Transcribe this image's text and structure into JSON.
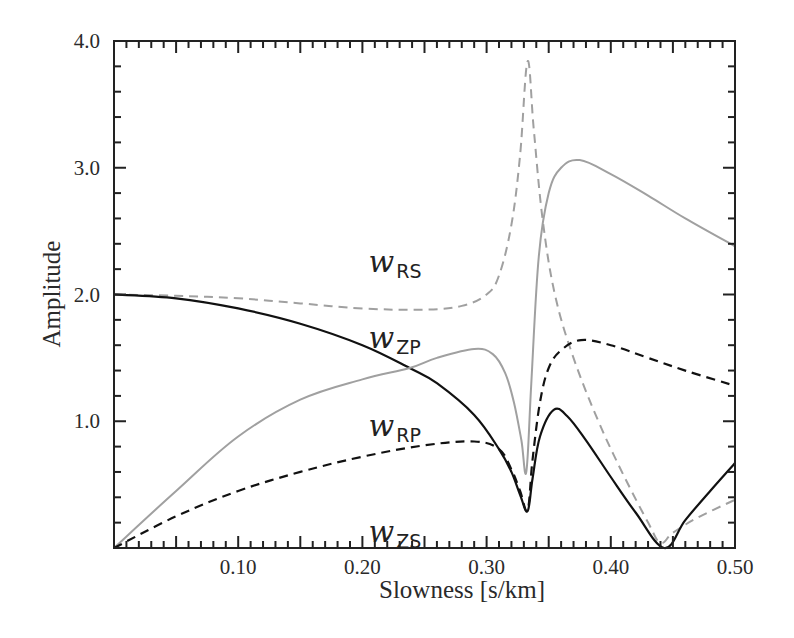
{
  "chart_data": {
    "type": "line",
    "title": "",
    "xlabel": "Slowness [s/km]",
    "ylabel": "Amplitude",
    "xlim": [
      0,
      0.5
    ],
    "ylim": [
      0,
      4.0
    ],
    "grid": false,
    "legend": "inline labels",
    "x_ticks": [
      0.1,
      0.2,
      0.3,
      0.4,
      0.5
    ],
    "x_tick_labels": [
      "0.10",
      "0.20",
      "0.30",
      "0.40",
      "0.50"
    ],
    "y_ticks": [
      1.0,
      2.0,
      3.0,
      4.0
    ],
    "y_tick_labels": [
      "1.0",
      "2.0",
      "3.0",
      "4.0"
    ],
    "series": [
      {
        "name": "w_RS",
        "label_main": "w",
        "label_sub": "RS",
        "style": "dashed",
        "color": "#a0a0a0",
        "points": [
          [
            0.0,
            2.0
          ],
          [
            0.05,
            1.99
          ],
          [
            0.1,
            1.97
          ],
          [
            0.15,
            1.93
          ],
          [
            0.2,
            1.89
          ],
          [
            0.25,
            1.88
          ],
          [
            0.28,
            1.91
          ],
          [
            0.3,
            2.0
          ],
          [
            0.31,
            2.15
          ],
          [
            0.32,
            2.55
          ],
          [
            0.327,
            3.1
          ],
          [
            0.333,
            3.84
          ],
          [
            0.338,
            3.3
          ],
          [
            0.345,
            2.6
          ],
          [
            0.355,
            2.0
          ],
          [
            0.37,
            1.5
          ],
          [
            0.39,
            1.0
          ],
          [
            0.41,
            0.58
          ],
          [
            0.43,
            0.2
          ],
          [
            0.44,
            0.04
          ],
          [
            0.45,
            0.12
          ],
          [
            0.47,
            0.24
          ],
          [
            0.5,
            0.38
          ]
        ]
      },
      {
        "name": "w_ZP",
        "label_main": "w",
        "label_sub": "ZP",
        "style": "solid",
        "color": "#111111",
        "points": [
          [
            0.0,
            2.0
          ],
          [
            0.05,
            1.97
          ],
          [
            0.1,
            1.89
          ],
          [
            0.15,
            1.77
          ],
          [
            0.2,
            1.6
          ],
          [
            0.238,
            1.42
          ],
          [
            0.26,
            1.3
          ],
          [
            0.29,
            1.05
          ],
          [
            0.31,
            0.78
          ],
          [
            0.32,
            0.6
          ],
          [
            0.327,
            0.42
          ],
          [
            0.333,
            0.29
          ],
          [
            0.337,
            0.55
          ],
          [
            0.343,
            0.88
          ],
          [
            0.354,
            1.09
          ],
          [
            0.365,
            1.04
          ],
          [
            0.38,
            0.85
          ],
          [
            0.4,
            0.56
          ],
          [
            0.42,
            0.28
          ],
          [
            0.443,
            0.0
          ],
          [
            0.46,
            0.22
          ],
          [
            0.48,
            0.45
          ],
          [
            0.5,
            0.67
          ]
        ]
      },
      {
        "name": "w_RP",
        "label_main": "w",
        "label_sub": "RP",
        "style": "solid",
        "color": "#a0a0a0",
        "points": [
          [
            0.0,
            0.0
          ],
          [
            0.05,
            0.45
          ],
          [
            0.1,
            0.88
          ],
          [
            0.15,
            1.17
          ],
          [
            0.2,
            1.33
          ],
          [
            0.238,
            1.42
          ],
          [
            0.26,
            1.5
          ],
          [
            0.29,
            1.57
          ],
          [
            0.305,
            1.53
          ],
          [
            0.315,
            1.38
          ],
          [
            0.322,
            1.15
          ],
          [
            0.328,
            0.85
          ],
          [
            0.332,
            0.6
          ],
          [
            0.336,
            1.3
          ],
          [
            0.342,
            2.3
          ],
          [
            0.35,
            2.8
          ],
          [
            0.36,
            3.0
          ],
          [
            0.375,
            3.06
          ],
          [
            0.4,
            2.95
          ],
          [
            0.43,
            2.78
          ],
          [
            0.46,
            2.6
          ],
          [
            0.5,
            2.38
          ]
        ]
      },
      {
        "name": "w_ZS",
        "label_main": "w",
        "label_sub": "ZS",
        "style": "dashed",
        "color": "#111111",
        "points": [
          [
            0.0,
            0.0
          ],
          [
            0.05,
            0.25
          ],
          [
            0.1,
            0.45
          ],
          [
            0.15,
            0.6
          ],
          [
            0.2,
            0.72
          ],
          [
            0.25,
            0.81
          ],
          [
            0.29,
            0.84
          ],
          [
            0.31,
            0.78
          ],
          [
            0.32,
            0.62
          ],
          [
            0.327,
            0.45
          ],
          [
            0.333,
            0.3
          ],
          [
            0.337,
            0.7
          ],
          [
            0.343,
            1.15
          ],
          [
            0.35,
            1.42
          ],
          [
            0.36,
            1.56
          ],
          [
            0.376,
            1.64
          ],
          [
            0.4,
            1.6
          ],
          [
            0.43,
            1.5
          ],
          [
            0.46,
            1.4
          ],
          [
            0.5,
            1.28
          ]
        ]
      }
    ],
    "labels": [
      {
        "series": "w_RS",
        "x": 0.205,
        "y": 2.18
      },
      {
        "series": "w_ZP",
        "x": 0.205,
        "y": 1.58
      },
      {
        "series": "w_RP",
        "x": 0.205,
        "y": 0.88
      },
      {
        "series": "w_ZS",
        "x": 0.205,
        "y": 0.05
      }
    ]
  }
}
